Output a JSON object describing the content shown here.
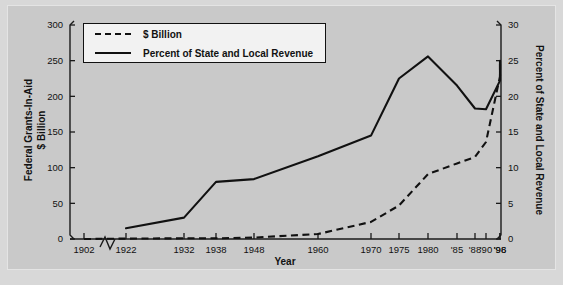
{
  "chart_data": {
    "type": "line",
    "title": "",
    "xlabel": "Year",
    "ylabel": "Federal Grants-In-Aid  $ Billion",
    "y2label": "Percent of State and Local Revenue",
    "ylim": [
      0,
      300
    ],
    "y2lim": [
      0,
      30
    ],
    "yticks": [
      "0",
      "50",
      "100",
      "150",
      "200",
      "250",
      "300"
    ],
    "y2ticks": [
      "0",
      "5",
      "10",
      "15",
      "20",
      "25",
      "30"
    ],
    "xticklabels": [
      "1902",
      "1922",
      "1932",
      "1938",
      "1948",
      "1960",
      "1970",
      "1975",
      "1980",
      "'85",
      "'88",
      "'90",
      "'96",
      "'98"
    ],
    "x": [
      1902,
      1922,
      1932,
      1938,
      1948,
      1960,
      1970,
      1975,
      1980,
      1985,
      1988,
      1990,
      1996,
      1998
    ],
    "grid": false,
    "axis_break": "between 1902 and 1922",
    "legend_position": "upper-left-inside",
    "series": [
      {
        "name": "$ Billion",
        "style": "dashed",
        "axis": "left",
        "values": [
          0,
          0.5,
          1,
          1,
          2,
          7,
          24,
          47,
          91,
          106,
          115,
          136,
          228,
          246
        ]
      },
      {
        "name": "Percent of State and Local Revenue",
        "style": "solid",
        "axis": "right",
        "values": [
          null,
          1.5,
          3,
          8,
          8.4,
          11.6,
          14.5,
          22.5,
          25.6,
          21.5,
          18.3,
          18.2,
          22.2,
          25.0
        ]
      }
    ]
  },
  "legend": {
    "items": [
      {
        "label": "$ Billion",
        "style": "dashed"
      },
      {
        "label": "Percent of State and Local Revenue",
        "style": "solid"
      }
    ]
  },
  "axes": {
    "left_title_line1": "Federal Grants-In-Aid",
    "left_title_line2": "$ Billion",
    "right_title": "Percent of State and Local Revenue",
    "bottom_title": "Year"
  }
}
